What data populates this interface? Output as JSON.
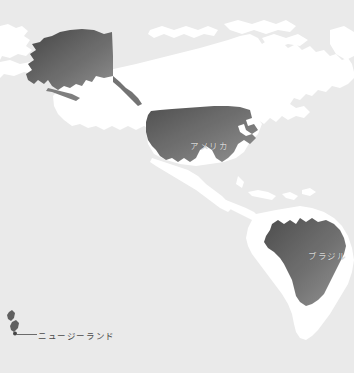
{
  "map": {
    "title": "World map with highlighted countries",
    "projection": "equirectangular-americas",
    "background_color": "#eaeaea",
    "land_color": "#ffffff",
    "margin_color": "#ffffff",
    "highlight_dark": "#4e4e4e",
    "highlight_light": "#8a8a8a",
    "label_color": "#d8d8d8",
    "callout_label_color": "#4a4a4a",
    "leader_line_color": "#6b6b6b"
  },
  "labels": {
    "america": "アメリカ",
    "brazil": "ブラジル",
    "newzealand": "ニュージーランド"
  },
  "highlighted_regions": [
    {
      "id": "alaska",
      "label": "",
      "fill": "gradient-dark"
    },
    {
      "id": "usa",
      "label": "アメリカ",
      "fill": "gradient-dark"
    },
    {
      "id": "brazil",
      "label": "ブラジル",
      "fill": "gradient-dark"
    },
    {
      "id": "newzealand",
      "label": "ニュージーランド",
      "fill": "solid-dark"
    }
  ],
  "unhighlighted_land": [
    "canada",
    "greenland-edge",
    "mexico",
    "central-america",
    "caribbean",
    "south-america-rest"
  ]
}
